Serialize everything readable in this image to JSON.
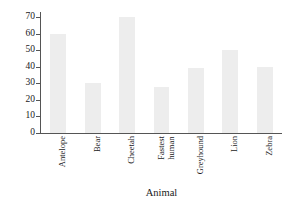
{
  "chart_data": {
    "type": "bar",
    "title": "",
    "xlabel": "Animal",
    "ylabel": "Speed (in miles per hour)",
    "categories": [
      "Antelope",
      "Bear",
      "Cheetah",
      "Fastest human",
      "Greyhound",
      "Lion",
      "Zebra"
    ],
    "values": [
      60,
      30,
      70,
      28,
      39,
      50,
      40
    ],
    "ylim": [
      0,
      73
    ],
    "yticks": [
      0,
      10,
      20,
      30,
      40,
      50,
      60,
      70
    ],
    "ytick_labels": [
      "0",
      "10",
      "20",
      "30",
      "40",
      "50",
      "60",
      "70"
    ],
    "grid": false,
    "legend": "none",
    "bar_color": "#ededed",
    "axis_color": "#555555",
    "text_color": "#1a1a1a"
  },
  "category_lines": [
    [
      "Antelope"
    ],
    [
      "Bear"
    ],
    [
      "Cheetah"
    ],
    [
      "Fastest",
      "human"
    ],
    [
      "Greyhound"
    ],
    [
      "Lion"
    ],
    [
      "Zebra"
    ]
  ]
}
